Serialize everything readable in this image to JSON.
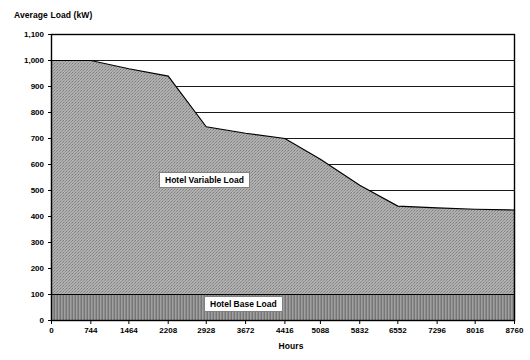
{
  "chart_data": {
    "type": "area",
    "title": "",
    "ylabel": "Average Load (kW)",
    "xlabel": "Hours",
    "ylim": [
      0,
      1100
    ],
    "xlim": [
      0,
      8760
    ],
    "grid": "horizontal",
    "legend_position": "inline-annotations",
    "y_ticks": [
      "0",
      "100",
      "200",
      "300",
      "400",
      "500",
      "600",
      "700",
      "800",
      "900",
      "1,000",
      "1,100"
    ],
    "y_tick_values": [
      0,
      100,
      200,
      300,
      400,
      500,
      600,
      700,
      800,
      900,
      1000,
      1100
    ],
    "x_ticks": [
      "0",
      "744",
      "1464",
      "2208",
      "2928",
      "3672",
      "4416",
      "5088",
      "5832",
      "6552",
      "7296",
      "8016",
      "8760"
    ],
    "x_tick_values": [
      0,
      744,
      1464,
      2208,
      2928,
      3672,
      4416,
      5088,
      5832,
      6552,
      7296,
      8016,
      8760
    ],
    "series": [
      {
        "name": "Hotel Variable Load",
        "type": "area",
        "fill": "#a8a8a8",
        "pattern": "dotted-gray",
        "x": [
          0,
          744,
          1464,
          2208,
          2928,
          3672,
          4416,
          5088,
          5832,
          6552,
          7296,
          8016,
          8760
        ],
        "values": [
          1000,
          1000,
          968,
          940,
          745,
          720,
          700,
          620,
          520,
          440,
          433,
          428,
          425
        ]
      },
      {
        "name": "Hotel Base Load",
        "type": "area",
        "fill": "#8f8f8f",
        "pattern": "vertical-hatch",
        "x": [
          0,
          8760
        ],
        "values": [
          100,
          100
        ]
      }
    ],
    "annotations": [
      {
        "text": "Hotel Variable Load",
        "x": 2700,
        "y": 505
      },
      {
        "text": "Hotel Base Load",
        "x": 4500,
        "y": 65
      }
    ]
  },
  "labels": {
    "y_axis_title": "Average Load (kW)",
    "x_axis_title": "Hours",
    "variable_load": "Hotel Variable Load",
    "base_load": "Hotel Base Load"
  },
  "colors": {
    "axis": "#000000",
    "grid": "#000000",
    "variable_fill": "#a8a8a8",
    "base_fill": "#8f8f8f",
    "background": "#ffffff"
  }
}
